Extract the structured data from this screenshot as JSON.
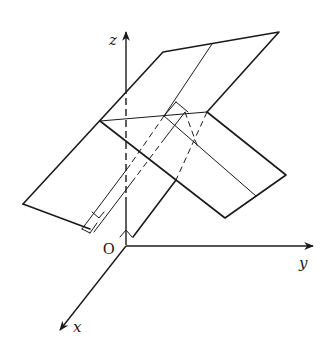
{
  "diagram": {
    "type": "3d-coordinate-planes",
    "labels": {
      "z_axis": "z",
      "y_axis": "y",
      "x_axis": "x",
      "origin": "O"
    },
    "colors": {
      "ink": "#1a1a1a",
      "background": "#ffffff"
    }
  }
}
